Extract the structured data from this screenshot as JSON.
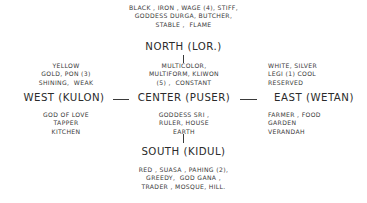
{
  "diagram": {
    "ink_color": "#3a3a3a",
    "background_color": "#ffffff",
    "north": {
      "label": "NORTH (LOR.)",
      "attributes": "BLACK , IRON , WAGE (4), STIFF,\nGODDESS DURGA, BUTCHER,\nSTABLE ,  FLAME"
    },
    "south": {
      "label": "SOUTH (KIDUL)",
      "attributes": "RED , SUASA , PAHING (2),\nGREEDY,  GOD GANA ,\nTRADER , MOSQUE, HILL."
    },
    "west": {
      "label": "WEST (KULON)",
      "attributes_top": "YELLOW\nGOLD, PON (3)\nSHINING,  WEAK",
      "attributes_bottom": "GOD OF LOVE\nTAPPER\nKITCHEN"
    },
    "center": {
      "label": "CENTER (PUSER)",
      "attributes_top": "MULTICOLOR,\nMULTIFORM, KLIWON\n(5) ,  CONSTANT",
      "attributes_bottom": "GODDESS SRI ,\nRULER, HOUSE\nEARTH"
    },
    "east": {
      "label": "EAST (WETAN)",
      "attributes_top": "WHITE, SILVER\nLEGI (1) COOL\nRESERVED",
      "attributes_bottom": "FARMER , FOOD\nGARDEN\nVERANDAH"
    }
  }
}
